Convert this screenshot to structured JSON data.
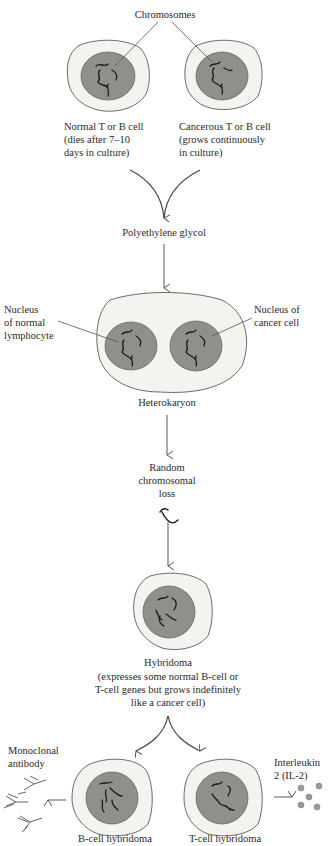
{
  "diagram": {
    "colors": {
      "cytoplasm": "#f3f3ef",
      "nucleus": "#8f8f8c",
      "outline": "#5a5a5a",
      "chromosome": "#1a1a1a",
      "arrow": "#555555",
      "il2_particle": "#9a9a96"
    },
    "labels": {
      "chromosomes": "Chromosomes",
      "normal_cell": [
        "Normal T or B cell",
        "(dies after 7–10",
        "days in culture)"
      ],
      "cancer_cell": [
        "Cancerous T or B cell",
        "(grows continuously",
        "in culture)"
      ],
      "fusion_agent": "Polyethylene glycol",
      "nucleus_normal": [
        "Nucleus",
        "of normal",
        "lymphocyte"
      ],
      "nucleus_cancer": [
        "Nucleus of",
        "cancer cell"
      ],
      "heterokaryon": "Heterokaryon",
      "chromosome_loss": [
        "Random",
        "chromosomal",
        "loss"
      ],
      "hybridoma": "Hybridoma",
      "hybridoma_desc": [
        "(expresses some normal B-cell or",
        "T-cell genes but grows indefinitely",
        "like a cancer cell)"
      ],
      "monoclonal": [
        "Monoclonal",
        "antibody"
      ],
      "interleukin": [
        "Interleukin",
        "2 (IL-2)"
      ],
      "b_hybridoma": "B-cell hybridoma",
      "t_hybridoma": "T-cell hybridoma"
    }
  }
}
